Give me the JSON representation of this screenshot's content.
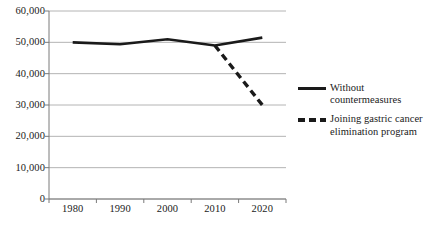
{
  "chart_data": {
    "type": "line",
    "title": "",
    "xlabel": "",
    "ylabel": "",
    "x": [
      1980,
      1990,
      2000,
      2010,
      2020
    ],
    "categories": [
      "1980",
      "1990",
      "2000",
      "2010",
      "2020"
    ],
    "xtick_labels": [
      "1980",
      "1990",
      "2000",
      "2010",
      "2020"
    ],
    "ytick_labels": [
      "0",
      "10,000",
      "20,000",
      "30,000",
      "40,000",
      "50,000",
      "60,000"
    ],
    "ytick_values": [
      0,
      10000,
      20000,
      30000,
      40000,
      50000,
      60000
    ],
    "ylim": [
      0,
      60000
    ],
    "grid": true,
    "grid_axis": "y",
    "legend_position": "right",
    "series": [
      {
        "name": "Without\ncountermeasures",
        "style": "solid",
        "color": "#1a1a1a",
        "x": [
          1980,
          1990,
          2000,
          2010,
          2020
        ],
        "values": [
          50000,
          49400,
          51000,
          49000,
          51500
        ]
      },
      {
        "name": "Joining gastric cancer\nelimination program",
        "style": "dashed",
        "color": "#1a1a1a",
        "x": [
          2010,
          2020
        ],
        "values": [
          49000,
          30000
        ]
      }
    ]
  },
  "legend": {
    "entries": [
      {
        "label": "Without\ncountermeasures",
        "style": "solid"
      },
      {
        "label": "Joining gastric cancer\nelimination program",
        "style": "dashed"
      }
    ]
  },
  "colors": {
    "line": "#1a1a1a",
    "grid": "#b4b4b4",
    "axis": "#7a7a7a",
    "background": "#ffffff",
    "text": "#1a1a1a"
  }
}
